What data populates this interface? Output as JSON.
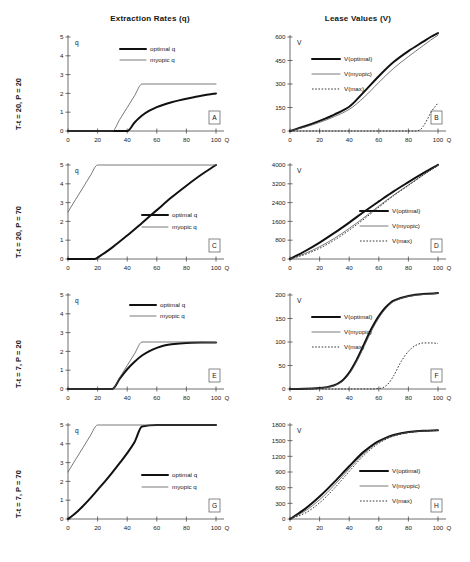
{
  "figure": {
    "column_titles": [
      "Extraction Rates (q)",
      "Lease Values (V)"
    ],
    "row_labels": [
      "T-t = 20, P = 20",
      "T-t = 20, P = 70",
      "T-t = 7, P = 20",
      "T-t = 7, P = 70"
    ],
    "x_axis_name": "Q",
    "q_axis_name": "q",
    "v_axis_name": "V",
    "x_ticks": [
      "0",
      "20",
      "40",
      "60",
      "80",
      "100"
    ],
    "legend_q": [
      "optimal q",
      "myopic q"
    ],
    "legend_v": [
      "V(optimal)",
      "V(myopic)",
      "V(max)"
    ],
    "panel_letters": [
      "A",
      "B",
      "C",
      "D",
      "E",
      "F",
      "G",
      "H"
    ]
  },
  "chart_data": [
    {
      "type": "line",
      "panel": "A",
      "title": "Extraction Rates (q)",
      "condition": "T-t = 20, P = 20",
      "xlabel": "Q",
      "ylabel": "q",
      "xlim": [
        0,
        100
      ],
      "ylim": [
        0,
        5
      ],
      "yticks": [
        "0",
        "1",
        "2",
        "3",
        "4",
        "5"
      ],
      "xticks": [
        "0",
        "20",
        "40",
        "60",
        "80",
        "100"
      ],
      "grid": false,
      "legend_position": "top-center",
      "series": [
        {
          "name": "optimal q",
          "style": "thick-solid",
          "x": [
            0,
            10,
            20,
            30,
            38,
            40,
            45,
            50,
            55,
            60,
            65,
            70,
            75,
            80,
            85,
            90,
            95,
            100
          ],
          "values": [
            0,
            0,
            0,
            0,
            0,
            0,
            0.45,
            0.82,
            1.08,
            1.27,
            1.41,
            1.53,
            1.63,
            1.72,
            1.8,
            1.87,
            1.94,
            2.0
          ]
        },
        {
          "name": "myopic q",
          "style": "thin-solid",
          "x": [
            0,
            10,
            20,
            30,
            35,
            40,
            45,
            50,
            60,
            70,
            80,
            90,
            100
          ],
          "values": [
            0,
            0,
            0,
            0,
            0.62,
            1.25,
            1.88,
            2.5,
            2.5,
            2.5,
            2.5,
            2.5,
            2.5
          ]
        }
      ]
    },
    {
      "type": "line",
      "panel": "B",
      "title": "Lease Values (V)",
      "condition": "T-t = 20, P = 20",
      "xlabel": "Q",
      "ylabel": "V",
      "xlim": [
        0,
        100
      ],
      "ylim": [
        0,
        600
      ],
      "yticks": [
        "0",
        "150",
        "300",
        "450",
        "600"
      ],
      "xticks": [
        "0",
        "20",
        "40",
        "60",
        "80",
        "100"
      ],
      "grid": false,
      "legend_position": "mid-left",
      "series": [
        {
          "name": "V(optimal)",
          "style": "thick-solid",
          "x": [
            0,
            10,
            20,
            30,
            40,
            50,
            60,
            70,
            80,
            90,
            95,
            100
          ],
          "values": [
            0,
            30,
            65,
            105,
            155,
            250,
            350,
            440,
            510,
            570,
            600,
            625
          ]
        },
        {
          "name": "V(myopic)",
          "style": "thin-solid",
          "x": [
            0,
            10,
            20,
            30,
            40,
            50,
            60,
            70,
            80,
            90,
            95,
            100
          ],
          "values": [
            0,
            25,
            55,
            92,
            138,
            215,
            310,
            400,
            475,
            545,
            580,
            612
          ]
        },
        {
          "name": "V(max)",
          "style": "dotted",
          "x": [
            0,
            60,
            80,
            85,
            88,
            90,
            93,
            96,
            100
          ],
          "values": [
            0,
            0,
            0,
            0,
            8,
            30,
            78,
            130,
            178
          ]
        }
      ]
    },
    {
      "type": "line",
      "panel": "C",
      "title": "Extraction Rates (q)",
      "condition": "T-t = 20, P = 70",
      "xlabel": "Q",
      "ylabel": "q",
      "xlim": [
        0,
        100
      ],
      "ylim": [
        0,
        5
      ],
      "yticks": [
        "0",
        "1",
        "2",
        "3",
        "4",
        "5"
      ],
      "xticks": [
        "0",
        "20",
        "40",
        "60",
        "80",
        "100"
      ],
      "grid": false,
      "legend_position": "mid-right",
      "series": [
        {
          "name": "optimal q",
          "style": "thick-solid",
          "x": [
            0,
            10,
            18,
            22,
            30,
            40,
            50,
            60,
            70,
            80,
            90,
            100
          ],
          "values": [
            0,
            0,
            0,
            0.18,
            0.62,
            1.25,
            1.92,
            2.6,
            3.28,
            3.9,
            4.48,
            5.0
          ]
        },
        {
          "name": "myopic q",
          "style": "thin-solid",
          "x": [
            0,
            5,
            10,
            15,
            20,
            22,
            40,
            60,
            80,
            100
          ],
          "values": [
            2.5,
            3.15,
            3.78,
            4.42,
            5.0,
            5.0,
            5.0,
            5.0,
            5.0,
            5.0
          ]
        }
      ]
    },
    {
      "type": "line",
      "panel": "D",
      "title": "Lease Values (V)",
      "condition": "T-t = 20, P = 70",
      "xlabel": "Q",
      "ylabel": "V",
      "xlim": [
        0,
        100
      ],
      "ylim": [
        0,
        4000
      ],
      "yticks": [
        "0",
        "800",
        "1600",
        "2400",
        "3200",
        "4000"
      ],
      "xticks": [
        "0",
        "20",
        "40",
        "60",
        "80",
        "100"
      ],
      "grid": false,
      "legend_position": "mid-right",
      "series": [
        {
          "name": "V(optimal)",
          "style": "thick-solid",
          "x": [
            0,
            10,
            20,
            30,
            40,
            50,
            60,
            70,
            80,
            90,
            100
          ],
          "values": [
            0,
            330,
            700,
            1110,
            1550,
            2010,
            2450,
            2880,
            3270,
            3650,
            4010
          ]
        },
        {
          "name": "V(myopic)",
          "style": "thin-solid",
          "x": [
            0,
            10,
            20,
            30,
            40,
            50,
            60,
            70,
            80,
            90,
            100
          ],
          "values": [
            0,
            230,
            520,
            880,
            1300,
            1760,
            2250,
            2720,
            3150,
            3580,
            3990
          ]
        },
        {
          "name": "V(max)",
          "style": "dotted",
          "x": [
            0,
            10,
            20,
            30,
            40,
            50,
            60,
            70,
            80,
            90,
            100
          ],
          "values": [
            0,
            190,
            455,
            805,
            1225,
            1700,
            2200,
            2690,
            3130,
            3570,
            3980
          ]
        }
      ]
    },
    {
      "type": "line",
      "panel": "E",
      "title": "Extraction Rates (q)",
      "condition": "T-t = 7, P = 20",
      "xlabel": "Q",
      "ylabel": "q",
      "xlim": [
        0,
        100
      ],
      "ylim": [
        0,
        5
      ],
      "yticks": [
        "0",
        "1",
        "2",
        "3",
        "4",
        "5"
      ],
      "xticks": [
        "0",
        "20",
        "40",
        "60",
        "80",
        "100"
      ],
      "grid": false,
      "legend_position": "top-center",
      "series": [
        {
          "name": "optimal q",
          "style": "thick-solid",
          "x": [
            0,
            20,
            30,
            35,
            40,
            45,
            50,
            55,
            60,
            65,
            70,
            80,
            90,
            100
          ],
          "values": [
            0,
            0,
            0,
            0.55,
            1.05,
            1.45,
            1.78,
            2.02,
            2.19,
            2.31,
            2.38,
            2.45,
            2.47,
            2.47
          ]
        },
        {
          "name": "myopic q",
          "style": "thin-solid",
          "x": [
            0,
            20,
            30,
            35,
            40,
            45,
            50,
            60,
            80,
            100
          ],
          "values": [
            0,
            0,
            0,
            0.62,
            1.25,
            1.88,
            2.5,
            2.5,
            2.5,
            2.47
          ]
        }
      ]
    },
    {
      "type": "line",
      "panel": "F",
      "title": "Lease Values (V)",
      "condition": "T-t = 7, P = 20",
      "xlabel": "Q",
      "ylabel": "V",
      "xlim": [
        0,
        100
      ],
      "ylim": [
        0,
        200
      ],
      "yticks": [
        "0",
        "50",
        "100",
        "150",
        "200"
      ],
      "xticks": [
        "0",
        "20",
        "40",
        "60",
        "80",
        "100"
      ],
      "grid": false,
      "legend_position": "mid-left",
      "series": [
        {
          "name": "V(optimal)",
          "style": "thick-solid",
          "x": [
            0,
            10,
            20,
            25,
            30,
            35,
            40,
            45,
            50,
            55,
            60,
            65,
            70,
            80,
            90,
            100
          ],
          "values": [
            0,
            0.5,
            2,
            4,
            8,
            17,
            35,
            62,
            95,
            128,
            155,
            175,
            188,
            198,
            202,
            204
          ]
        },
        {
          "name": "V(myopic)",
          "style": "thin-solid",
          "x": [
            0,
            10,
            20,
            25,
            30,
            35,
            40,
            45,
            50,
            55,
            60,
            65,
            70,
            80,
            90,
            100
          ],
          "values": [
            0,
            0.4,
            1.6,
            3.4,
            7,
            15,
            32,
            58,
            90,
            123,
            151,
            172,
            186,
            197,
            201,
            203
          ]
        },
        {
          "name": "V(max)",
          "style": "dotted",
          "x": [
            0,
            55,
            62,
            66,
            70,
            75,
            80,
            85,
            90,
            95,
            100
          ],
          "values": [
            0,
            0,
            2,
            10,
            28,
            58,
            80,
            93,
            98,
            98,
            97
          ]
        }
      ]
    },
    {
      "type": "line",
      "panel": "G",
      "title": "Extraction Rates (q)",
      "condition": "T-t = 7, P = 70",
      "xlabel": "Q",
      "ylabel": "q",
      "xlim": [
        0,
        100
      ],
      "ylim": [
        0,
        5
      ],
      "yticks": [
        "0",
        "1",
        "2",
        "3",
        "4",
        "5"
      ],
      "xticks": [
        "0",
        "20",
        "40",
        "60",
        "80",
        "100"
      ],
      "grid": false,
      "legend_position": "mid-right",
      "series": [
        {
          "name": "optimal q",
          "style": "thick-solid",
          "x": [
            0,
            5,
            10,
            15,
            20,
            25,
            30,
            35,
            40,
            45,
            50,
            60,
            80,
            100
          ],
          "values": [
            0,
            0.3,
            0.68,
            1.1,
            1.55,
            2.0,
            2.48,
            2.98,
            3.5,
            4.1,
            4.92,
            5.0,
            5.0,
            5.0
          ]
        },
        {
          "name": "myopic q",
          "style": "thin-solid",
          "x": [
            0,
            5,
            10,
            15,
            20,
            22,
            40,
            60,
            80,
            100
          ],
          "values": [
            2.5,
            3.15,
            3.78,
            4.42,
            5.0,
            5.0,
            5.0,
            5.0,
            5.0,
            5.0
          ]
        }
      ]
    },
    {
      "type": "line",
      "panel": "H",
      "title": "Lease Values (V)",
      "condition": "T-t = 7, P = 70",
      "xlabel": "Q",
      "ylabel": "V",
      "xlim": [
        0,
        100
      ],
      "ylim": [
        0,
        1800
      ],
      "yticks": [
        "0",
        "300",
        "600",
        "900",
        "1200",
        "1500",
        "1800"
      ],
      "xticks": [
        "0",
        "20",
        "40",
        "60",
        "80",
        "100"
      ],
      "grid": false,
      "legend_position": "mid-right",
      "series": [
        {
          "name": "V(optimal)",
          "style": "thick-solid",
          "x": [
            0,
            10,
            20,
            30,
            40,
            50,
            60,
            70,
            80,
            90,
            100
          ],
          "values": [
            0,
            190,
            430,
            710,
            1010,
            1290,
            1490,
            1610,
            1665,
            1690,
            1700
          ]
        },
        {
          "name": "V(myopic)",
          "style": "thin-solid",
          "x": [
            0,
            10,
            20,
            30,
            40,
            50,
            60,
            70,
            80,
            90,
            100
          ],
          "values": [
            0,
            150,
            370,
            650,
            960,
            1255,
            1470,
            1598,
            1658,
            1686,
            1698
          ]
        },
        {
          "name": "V(max)",
          "style": "dotted",
          "x": [
            0,
            10,
            20,
            30,
            40,
            50,
            60,
            70,
            80,
            90,
            100
          ],
          "values": [
            0,
            110,
            310,
            590,
            910,
            1220,
            1450,
            1588,
            1652,
            1683,
            1697
          ]
        }
      ]
    }
  ]
}
